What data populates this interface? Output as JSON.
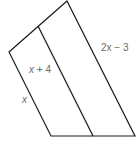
{
  "diagram": {
    "type": "geometry-figure",
    "shape": "quadrilateral divided by a segment into two regions",
    "stroke_color": "#1a1a1a",
    "label_color": "#6a6a6a",
    "vertices": {
      "left": [
        9,
        52
      ],
      "top": [
        67,
        1
      ],
      "bottom_right": [
        135,
        136
      ],
      "bottom_left": [
        51,
        136
      ]
    },
    "divider": {
      "from": [
        38,
        26
      ],
      "to": [
        93,
        136
      ]
    },
    "labels": [
      {
        "id": "right-side",
        "var": "2x",
        "rest": " − 3",
        "x": 101,
        "y": 51
      },
      {
        "id": "middle-strip",
        "var": "x",
        "rest": " + 4",
        "x": 29,
        "y": 73
      },
      {
        "id": "left-side",
        "var": "x",
        "rest": "",
        "x": 22,
        "y": 103
      }
    ]
  }
}
